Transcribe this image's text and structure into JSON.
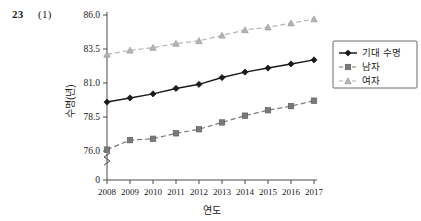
{
  "header": {
    "number": "23",
    "sub": "(1)"
  },
  "chart_data": {
    "type": "line",
    "title": "",
    "xlabel": "연도",
    "ylabel": "수명(년)",
    "categories": [
      "2008",
      "2009",
      "2010",
      "2011",
      "2012",
      "2013",
      "2014",
      "2015",
      "2016",
      "2017"
    ],
    "yticks": [
      "0",
      "76.0",
      "78.5",
      "81.0",
      "83.5",
      "86.0"
    ],
    "ytick_values": [
      0,
      76.0,
      78.5,
      81.0,
      83.5,
      86.0
    ],
    "ylim": [
      76.0,
      86.0
    ],
    "y_axis_break": true,
    "grid": false,
    "legend_position": "right",
    "series": [
      {
        "name": "기대 수명",
        "marker": "diamond",
        "line_style": "solid",
        "color": "#1a1a1a",
        "values": [
          79.6,
          79.9,
          80.2,
          80.6,
          80.9,
          81.4,
          81.8,
          82.1,
          82.4,
          82.7
        ]
      },
      {
        "name": "남자",
        "marker": "square",
        "line_style": "dashed",
        "color": "#7a7a7a",
        "values": [
          76.1,
          76.8,
          76.9,
          77.3,
          77.6,
          78.1,
          78.6,
          79.0,
          79.3,
          79.7
        ]
      },
      {
        "name": "여자",
        "marker": "triangle",
        "line_style": "dashed",
        "color": "#b4b4b4",
        "values": [
          83.1,
          83.4,
          83.6,
          83.9,
          84.1,
          84.5,
          84.9,
          85.1,
          85.4,
          85.7
        ]
      }
    ]
  }
}
